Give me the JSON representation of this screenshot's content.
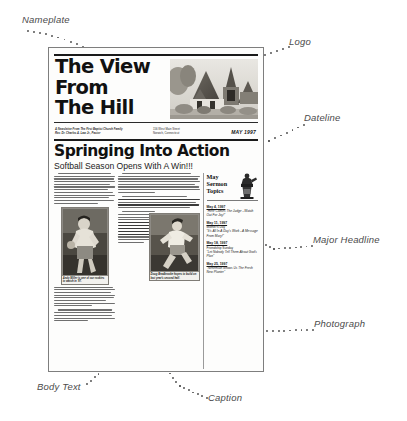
{
  "annotations": [
    {
      "id": "nameplate",
      "label": "Nameplate"
    },
    {
      "id": "logo",
      "label": "Logo"
    },
    {
      "id": "dateline",
      "label": "Dateline"
    },
    {
      "id": "major-headline",
      "label": "Major Headline"
    },
    {
      "id": "photograph",
      "label": "Photograph"
    },
    {
      "id": "body-text",
      "label": "Body Text"
    },
    {
      "id": "caption",
      "label": "Caption"
    }
  ],
  "newsletter": {
    "nameplate": {
      "line1": "The View",
      "line2": "From",
      "line3": "The Hill",
      "logo_alt": "church-building-photo"
    },
    "dateline": {
      "tagline_line1": "A Newsletter From The First Baptist Church Family",
      "tagline_line2": "Rev. Dr. Charles A. Law Jr., Pastor",
      "address_line1": "156 West Main Street",
      "address_line2": "Norwich, Connecticut",
      "date": "MAY 1997"
    },
    "headline": "Springing Into Action",
    "subhead": "Softball Season Opens With A Win!!!",
    "photo_captions": {
      "pitcher": "Andy Miller is one of our rookies to watch in '97.",
      "runner": "Doug Bradbrooke hopes to build on last year's second half."
    },
    "sidebar": {
      "heading_line1": "May",
      "heading_line2": "Sermon",
      "heading_line3": "Topics",
      "icon_alt": "pulpit-icon",
      "items": [
        {
          "date": "May 4, 1997",
          "title": "\"Here Comes The Judge - Watch Out For Joy!\""
        },
        {
          "date": "May 11, 1997",
          "title": "Mother's Day",
          "subtitle": "\"It's All In A Day's Work - A Message From Mary!\""
        },
        {
          "date": "May 18, 1997",
          "title": "Friendship Sunday",
          "subtitle": "\"Let Nobody Tell Them About God's Plan\""
        },
        {
          "date": "May 25, 1997",
          "title": "\"Nehemiah Shows Us The Fresh New Planter\""
        }
      ]
    }
  }
}
